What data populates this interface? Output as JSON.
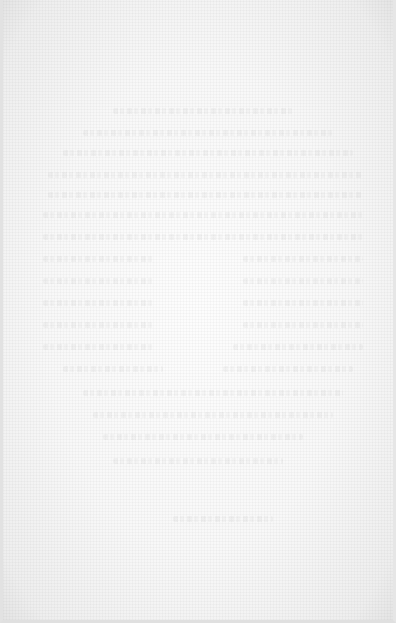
{
  "page": {
    "type": "faded scanned page",
    "background_color": "#f8f8f8",
    "legible_text": [],
    "ghost_lines": [
      {
        "top": 108,
        "left": 110,
        "width": 180
      },
      {
        "top": 130,
        "left": 80,
        "width": 250
      },
      {
        "top": 150,
        "left": 60,
        "width": 290
      },
      {
        "top": 172,
        "left": 45,
        "width": 315
      },
      {
        "top": 192,
        "left": 45,
        "width": 315
      },
      {
        "top": 212,
        "left": 40,
        "width": 320
      },
      {
        "top": 234,
        "left": 40,
        "width": 320
      },
      {
        "top": 256,
        "left": 40,
        "width": 110
      },
      {
        "top": 256,
        "left": 240,
        "width": 120
      },
      {
        "top": 278,
        "left": 40,
        "width": 110
      },
      {
        "top": 278,
        "left": 240,
        "width": 120
      },
      {
        "top": 300,
        "left": 40,
        "width": 110
      },
      {
        "top": 300,
        "left": 240,
        "width": 120
      },
      {
        "top": 322,
        "left": 40,
        "width": 110
      },
      {
        "top": 322,
        "left": 240,
        "width": 120
      },
      {
        "top": 344,
        "left": 40,
        "width": 110
      },
      {
        "top": 344,
        "left": 230,
        "width": 130
      },
      {
        "top": 366,
        "left": 60,
        "width": 100
      },
      {
        "top": 366,
        "left": 220,
        "width": 130
      },
      {
        "top": 390,
        "left": 80,
        "width": 260
      },
      {
        "top": 412,
        "left": 90,
        "width": 240
      },
      {
        "top": 434,
        "left": 100,
        "width": 200
      },
      {
        "top": 458,
        "left": 110,
        "width": 170
      },
      {
        "top": 516,
        "left": 170,
        "width": 100
      }
    ]
  }
}
